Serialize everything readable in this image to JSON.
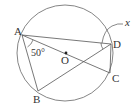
{
  "diagram": {
    "type": "circle-geometry",
    "stroke_color": "#555555",
    "circle": {
      "center_label": "O",
      "cx": 65,
      "cy": 53,
      "r": 48
    },
    "points": {
      "A": {
        "label": "A",
        "x": 22,
        "y": 35
      },
      "B": {
        "label": "B",
        "x": 38,
        "y": 91
      },
      "C": {
        "label": "C",
        "x": 110,
        "y": 73
      },
      "D": {
        "label": "D",
        "x": 111,
        "y": 44
      }
    },
    "segments": [
      "AB",
      "AD",
      "AC",
      "BD",
      "DC"
    ],
    "angle_label": "50°",
    "unknown_label": "x"
  }
}
